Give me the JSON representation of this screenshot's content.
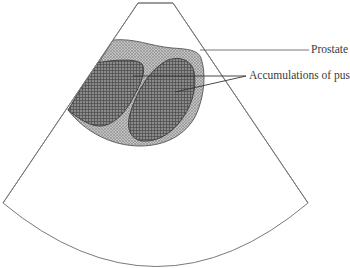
{
  "diagram": {
    "type": "ultrasound-schematic",
    "view": "sector scan",
    "labels": {
      "prostate": "Prostate",
      "pus": "Accumulations of pus"
    },
    "colors": {
      "outline": "#6a6a6a",
      "prostate_fill": "#b4b4b4",
      "pus_fill": "#7a7a7a",
      "leader_line": "#555555",
      "background": "#ffffff"
    }
  }
}
